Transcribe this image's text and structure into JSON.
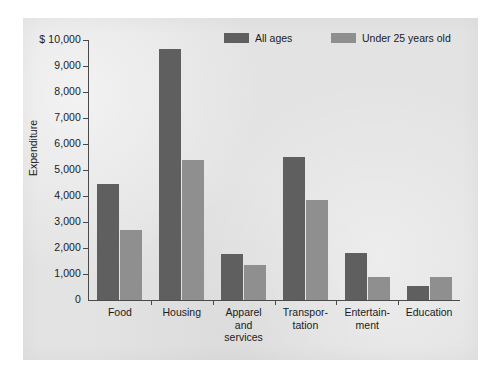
{
  "chart_data": {
    "type": "bar",
    "title": "",
    "subtitle": "",
    "xlabel": "",
    "ylabel": "Expenditure",
    "y_axis_prefix": "$",
    "ylim": [
      0,
      10000
    ],
    "ytick_values": [
      0,
      1000,
      2000,
      3000,
      4000,
      5000,
      6000,
      7000,
      8000,
      9000,
      10000
    ],
    "ytick_labels": [
      "0",
      "1,000",
      "2,000",
      "3,000",
      "4,000",
      "5,000",
      "6,000",
      "7,000",
      "8,000",
      "9,000",
      "$ 10,000"
    ],
    "grid": false,
    "legend_position": "top-center",
    "categories": [
      "Food",
      "Housing",
      "Apparel\nand\nservices",
      "Transpor-\ntation",
      "Entertain-\nment",
      "Education"
    ],
    "category_labels_flat": [
      "Food",
      "Housing",
      "Apparel and services",
      "Transportation",
      "Entertainment",
      "Education"
    ],
    "series": [
      {
        "name": "All ages",
        "color": "#5f5f5f",
        "values": [
          4450,
          9650,
          1780,
          5500,
          1800,
          550
        ]
      },
      {
        "name": "Under 25 years old",
        "color": "#8f8f8f",
        "values": [
          2700,
          5400,
          1350,
          3850,
          880,
          900
        ]
      }
    ]
  },
  "legend": {
    "items": [
      {
        "label": "All ages"
      },
      {
        "label": "Under 25 years old"
      }
    ]
  },
  "colors": {
    "series_all_ages": "#5f5f5f",
    "series_under_25": "#8f8f8f",
    "panel_background": "#e3e3e3",
    "axis": "#4a4a4a",
    "text": "#1b1b1b",
    "figure_background": "#ffffff"
  }
}
